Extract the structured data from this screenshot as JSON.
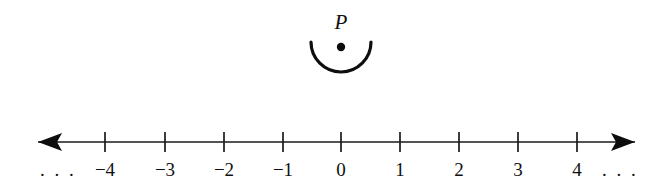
{
  "figure": {
    "background_color": "#ffffff",
    "ink_color": "#0d0d0d"
  },
  "point_marker": {
    "label": "P",
    "label_x": 341,
    "label_y": 29,
    "dot_x": 341,
    "dot_y": 47,
    "dot_radius": 4.2,
    "arc_center_x": 341,
    "arc_center_y": 42,
    "arc_radius": 30,
    "arc_description": "semicircular-cup-opening-upward"
  },
  "number_line": {
    "axis_y": 142,
    "axis_start_x": 38,
    "axis_end_x": 635,
    "tick_half_height": 10,
    "tick_spacing": 59,
    "label_y": 176,
    "left_arrow": "arrow-left",
    "right_arrow": "arrow-right",
    "left_ellipsis": ". . .",
    "left_ellipsis_x": 58,
    "right_ellipsis": ". . .",
    "right_ellipsis_x": 620,
    "ticks": [
      {
        "label": "−4",
        "value": -4,
        "x": 105
      },
      {
        "label": "−3",
        "value": -3,
        "x": 165
      },
      {
        "label": "−2",
        "value": -2,
        "x": 224
      },
      {
        "label": "−1",
        "value": -1,
        "x": 283
      },
      {
        "label": "0",
        "value": 0,
        "x": 341
      },
      {
        "label": "1",
        "value": 1,
        "x": 400
      },
      {
        "label": "2",
        "value": 2,
        "x": 459
      },
      {
        "label": "3",
        "value": 3,
        "x": 518
      },
      {
        "label": "4",
        "value": 4,
        "x": 577
      }
    ]
  },
  "chart_data": {
    "type": "line",
    "xlabel": "",
    "ylabel": "",
    "categories": [
      "−4",
      "−3",
      "−2",
      "−1",
      "0",
      "1",
      "2",
      "3",
      "4"
    ],
    "x": [
      -4,
      -3,
      -2,
      -1,
      0,
      1,
      2,
      3,
      4
    ],
    "xlim": [
      -5,
      5
    ],
    "grid": false,
    "legend": "none",
    "annotations": [
      {
        "text": "P",
        "x": 0,
        "note": "point P marked above 0 inside an upward-opening semicircular arc"
      },
      {
        "text": ". . .",
        "x": -5,
        "note": "line continues to negative infinity"
      },
      {
        "text": ". . .",
        "x": 5,
        "note": "line continues to positive infinity"
      }
    ]
  }
}
